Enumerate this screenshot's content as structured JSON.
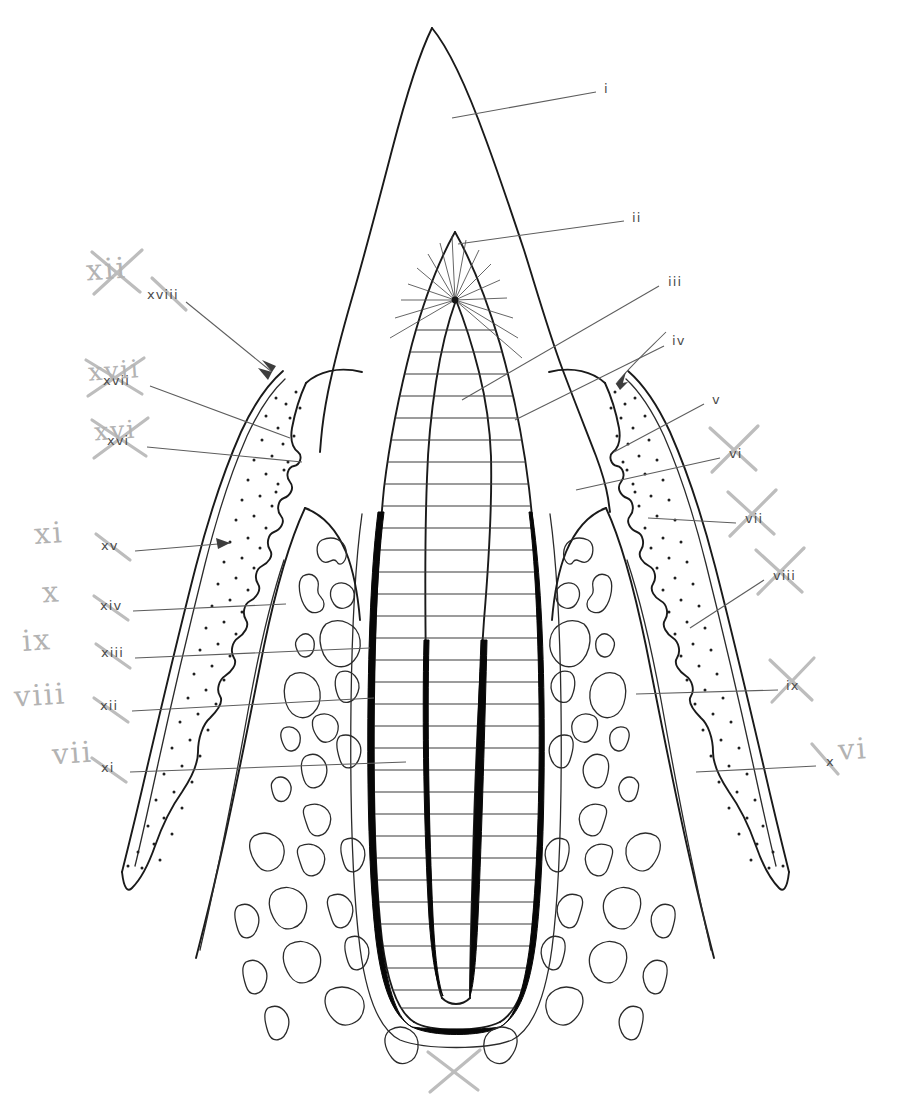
{
  "figure": {
    "kind": "line-drawing anatomical diagram",
    "ink_color": "#1a1a1a",
    "annotation_color": "#b3b3b3",
    "background": "#ffffff"
  },
  "printed_labels": [
    {
      "id": "i",
      "text": "i",
      "side": "right",
      "x": 604,
      "y": 89,
      "target": "crown / enamel"
    },
    {
      "id": "ii",
      "text": "ii",
      "side": "right",
      "x": 632,
      "y": 218,
      "target": "pulp horn / radiating dentinal tubules"
    },
    {
      "id": "iii",
      "text": "iii",
      "side": "right",
      "x": 668,
      "y": 282,
      "target": "dentine"
    },
    {
      "id": "iv",
      "text": "iv",
      "side": "right",
      "x": 672,
      "y": 341,
      "target": "pulp chamber"
    },
    {
      "id": "v",
      "text": "v",
      "side": "right",
      "x": 712,
      "y": 400,
      "target": "free gingival margin"
    },
    {
      "id": "vi",
      "text": "vi",
      "side": "right",
      "x": 729,
      "y": 454,
      "target": "gingival sulcus / junctional epithelium"
    },
    {
      "id": "vii",
      "text": "vii",
      "side": "right",
      "x": 745,
      "y": 519,
      "target": "gingival connective tissue"
    },
    {
      "id": "viii",
      "text": "viii",
      "side": "right",
      "x": 773,
      "y": 576,
      "target": "attached gingiva"
    },
    {
      "id": "ix",
      "text": "ix",
      "side": "right",
      "x": 786,
      "y": 686,
      "target": "alveolar crest"
    },
    {
      "id": "x",
      "text": "x",
      "side": "right",
      "x": 826,
      "y": 762,
      "target": "trabecular (cancellous) bone"
    },
    {
      "id": "xi",
      "text": "xi",
      "side": "left",
      "x": 101,
      "y": 768,
      "target": "marrow space"
    },
    {
      "id": "xii",
      "text": "xii",
      "side": "left",
      "x": 100,
      "y": 706,
      "target": "periodontal ligament"
    },
    {
      "id": "xiii",
      "text": "xiii",
      "side": "left",
      "x": 101,
      "y": 653,
      "target": "lamina dura"
    },
    {
      "id": "xiv",
      "text": "xiv",
      "side": "left",
      "x": 100,
      "y": 606,
      "target": "alveolar bone proper"
    },
    {
      "id": "xv",
      "text": "xv",
      "side": "left",
      "x": 101,
      "y": 546,
      "target": "mucogingival junction"
    },
    {
      "id": "xvi",
      "text": "xvi",
      "side": "left",
      "x": 107,
      "y": 441,
      "target": "sulcular epithelium"
    },
    {
      "id": "xvii",
      "text": "xvii",
      "side": "left",
      "x": 103,
      "y": 381,
      "target": "gingival crest"
    },
    {
      "id": "xviii",
      "text": "xviii",
      "side": "left",
      "x": 147,
      "y": 295,
      "target": "interdental papilla"
    }
  ],
  "handwritten_annotations": [
    {
      "text": "xii",
      "x": 98,
      "y": 258,
      "struck": true,
      "note": "renumbering beside xviii"
    },
    {
      "text": "xvii",
      "x": 96,
      "y": 362,
      "struck": true,
      "note": "overwrites printed xvii"
    },
    {
      "text": "xvi",
      "x": 100,
      "y": 422,
      "struck": true,
      "note": "overwrites printed xvi"
    },
    {
      "text": "xi",
      "x": 42,
      "y": 526,
      "struck": false,
      "note": "renumbering of xv"
    },
    {
      "text": "x",
      "x": 48,
      "y": 585,
      "struck": false,
      "note": "renumbering of xiv"
    },
    {
      "text": "ix",
      "x": 30,
      "y": 633,
      "struck": false,
      "note": "renumbering of xiii"
    },
    {
      "text": "viii",
      "x": 22,
      "y": 688,
      "struck": false,
      "note": "renumbering of xii"
    },
    {
      "text": "vii",
      "x": 60,
      "y": 746,
      "struck": false,
      "note": "renumbering of xi"
    },
    {
      "text": "vi",
      "x": 838,
      "y": 742,
      "struck": false,
      "note": "renumbering beside x"
    },
    {
      "text": "vi",
      "x": 718,
      "y": 436,
      "struck": true,
      "note": "struck mark over printed vi"
    },
    {
      "text": "vii",
      "x": 738,
      "y": 500,
      "struck": true,
      "note": "struck mark over printed vii"
    },
    {
      "text": "viii",
      "x": 766,
      "y": 558,
      "struck": true,
      "note": "struck mark over printed viii"
    },
    {
      "text": "ix",
      "x": 778,
      "y": 668,
      "struck": true,
      "note": "struck mark over printed ix"
    },
    {
      "text": "a",
      "x": 442,
      "y": 1062,
      "struck": true,
      "note": "crossed-out caption at bottom centre"
    }
  ],
  "regions": [
    {
      "name": "enamel-crown",
      "fill": "none",
      "note": "pointed cusp, unshaded"
    },
    {
      "name": "dentine",
      "fill": "horizontal-hatch"
    },
    {
      "name": "pulp",
      "fill": "none",
      "note": "central chamber tapering into root canals"
    },
    {
      "name": "cementum",
      "fill": "solid-black",
      "note": "thick black line along root"
    },
    {
      "name": "gingiva",
      "fill": "stipple",
      "note": "dotted connective tissue, wavy inner border"
    },
    {
      "name": "alveolar-bone",
      "fill": "outline",
      "note": "trabecular marrow spaces as irregular blobs"
    }
  ],
  "bottom_caption": {
    "text": "a",
    "struck": true
  }
}
